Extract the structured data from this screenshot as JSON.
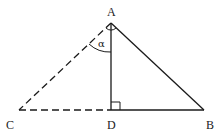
{
  "diagram": {
    "type": "geometry-triangle",
    "colors": {
      "stroke": "#1a1a1a",
      "background": "#ffffff"
    },
    "points": {
      "A": {
        "label": "A",
        "x": 111,
        "y": 23
      },
      "B": {
        "label": "B",
        "x": 204,
        "y": 110
      },
      "C": {
        "label": "C",
        "x": 19,
        "y": 110
      },
      "D": {
        "label": "D",
        "x": 111,
        "y": 110
      }
    },
    "segments": [
      {
        "from": "A",
        "to": "B",
        "style": "solid"
      },
      {
        "from": "A",
        "to": "D",
        "style": "solid"
      },
      {
        "from": "D",
        "to": "B",
        "style": "solid"
      },
      {
        "from": "A",
        "to": "C",
        "style": "dashed"
      },
      {
        "from": "C",
        "to": "D",
        "style": "dashed"
      }
    ],
    "angles": [
      {
        "label": "α",
        "vertex": "A",
        "between": [
          "C",
          "D"
        ]
      }
    ],
    "markers": [
      {
        "type": "right-angle",
        "vertex": "D"
      },
      {
        "type": "angle-arc",
        "vertex": "A"
      }
    ]
  }
}
